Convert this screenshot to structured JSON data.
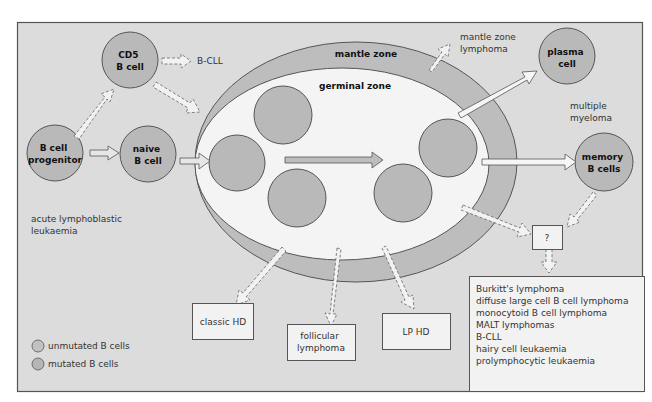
{
  "colors": {
    "panel_bg": "#dcdcdc",
    "panel_border": "#555555",
    "mantle_fill": "#bdbdbd",
    "germinal_fill": "#f4f4f4",
    "cell_fill": "#b9b9b9",
    "cell_stroke": "#555555",
    "box_fill": "#f2f2f2",
    "text": "#333333"
  },
  "zones": {
    "mantle": "mantle zone",
    "germinal": "germinal zone"
  },
  "cells": {
    "progenitor": [
      "B cell",
      "progenitor"
    ],
    "cd5": [
      "CD5",
      "B cell"
    ],
    "naive": [
      "naive",
      "B cell"
    ],
    "plasma": [
      "plasma",
      "cell"
    ],
    "memory": [
      "memory",
      "B cells"
    ]
  },
  "labels": {
    "b_cll": "B-CLL",
    "mantle_lymphoma": [
      "mantle zone",
      "lymphoma"
    ],
    "multiple_myeloma": [
      "multiple",
      "myeloma"
    ],
    "all": [
      "acute lymphoblastic",
      "leukaemia"
    ]
  },
  "boxes": {
    "classic_hd": "classic HD",
    "follicular": [
      "follicular",
      "lymphoma"
    ],
    "lp_hd": "LP HD",
    "question": "?",
    "list": [
      "Burkitt's lymphoma",
      "diffuse large cell B cell lymphoma",
      "monocytoid B cell lymphoma",
      "MALT lymphomas",
      "B-CLL",
      "hairy cell leukaemia",
      "prolymphocytic leukaemia"
    ]
  },
  "legend": {
    "items": [
      {
        "label": "unmutated B cells"
      },
      {
        "label": "mutated B cells"
      }
    ]
  }
}
